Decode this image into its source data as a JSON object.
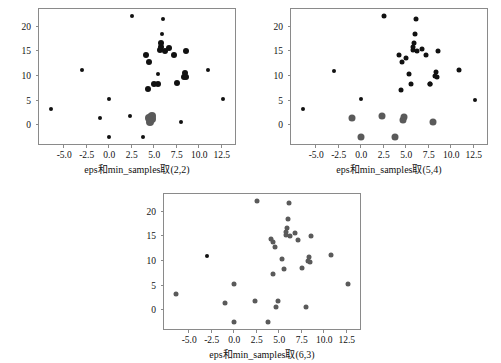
{
  "figure": {
    "background": "#ffffff",
    "width": 501,
    "height": 363
  },
  "chart_data": [
    {
      "type": "scatter",
      "id": "panel-2-2",
      "title": "",
      "xlabel": "eps和min_samples取(2,2)",
      "ylabel": "",
      "xlim": [
        -7.8,
        14.2
      ],
      "ylim": [
        -4.2,
        23.6
      ],
      "xticks": [
        "-5.0",
        "-2.5",
        "0.0",
        "2.5",
        "5.0",
        "7.5",
        "10.0",
        "12.5"
      ],
      "xtickvalues": [
        -5.0,
        -2.5,
        0.0,
        2.5,
        5.0,
        7.5,
        10.0,
        12.5
      ],
      "yticks": [
        "0",
        "5",
        "10",
        "15",
        "20"
      ],
      "ytickvalues": [
        0,
        5,
        10,
        15,
        20
      ],
      "grid": false,
      "legend": "none",
      "colors": {
        "noise": "#111111",
        "cluster0": "#5a5a5a"
      },
      "points": [
        {
          "x": -6.5,
          "y": 3.3,
          "c": "noise",
          "s": 4
        },
        {
          "x": -3.0,
          "y": 11.2,
          "c": "noise",
          "s": 4
        },
        {
          "x": -1.0,
          "y": 1.5,
          "c": "noise",
          "s": 4
        },
        {
          "x": 0.0,
          "y": 5.4,
          "c": "noise",
          "s": 4
        },
        {
          "x": 0.0,
          "y": -2.4,
          "c": "noise",
          "s": 4
        },
        {
          "x": 2.3,
          "y": 1.9,
          "c": "noise",
          "s": 4
        },
        {
          "x": 2.5,
          "y": 22.1,
          "c": "noise",
          "s": 4
        },
        {
          "x": 3.8,
          "y": -2.3,
          "c": "noise",
          "s": 4
        },
        {
          "x": 4.1,
          "y": 14.3,
          "c": "noise",
          "s": 6
        },
        {
          "x": 4.4,
          "y": 12.9,
          "c": "noise",
          "s": 6
        },
        {
          "x": 4.3,
          "y": 7.3,
          "c": "noise",
          "s": 6
        },
        {
          "x": 5.0,
          "y": 8.4,
          "c": "noise",
          "s": 6
        },
        {
          "x": 5.4,
          "y": 8.3,
          "c": "noise",
          "s": 6
        },
        {
          "x": 5.4,
          "y": 10.5,
          "c": "noise",
          "s": 4
        },
        {
          "x": 5.6,
          "y": 15.2,
          "c": "noise",
          "s": 6
        },
        {
          "x": 5.7,
          "y": 15.9,
          "c": "noise",
          "s": 6
        },
        {
          "x": 5.8,
          "y": 16.6,
          "c": "noise",
          "s": 6
        },
        {
          "x": 5.9,
          "y": 18.6,
          "c": "noise",
          "s": 4
        },
        {
          "x": 6.0,
          "y": 21.6,
          "c": "noise",
          "s": 4
        },
        {
          "x": 6.2,
          "y": 15.0,
          "c": "noise",
          "s": 6
        },
        {
          "x": 6.6,
          "y": 15.6,
          "c": "noise",
          "s": 6
        },
        {
          "x": 7.2,
          "y": 14.2,
          "c": "noise",
          "s": 6
        },
        {
          "x": 7.5,
          "y": 8.5,
          "c": "noise",
          "s": 6
        },
        {
          "x": 8.0,
          "y": 0.6,
          "c": "noise",
          "s": 4
        },
        {
          "x": 8.3,
          "y": 9.9,
          "c": "noise",
          "s": 6
        },
        {
          "x": 8.4,
          "y": 10.7,
          "c": "noise",
          "s": 6
        },
        {
          "x": 8.5,
          "y": 15.1,
          "c": "noise",
          "s": 6
        },
        {
          "x": 8.5,
          "y": 9.8,
          "c": "noise",
          "s": 6
        },
        {
          "x": 11.0,
          "y": 11.3,
          "c": "noise",
          "s": 4
        },
        {
          "x": 12.6,
          "y": 5.3,
          "c": "noise",
          "s": 4
        },
        {
          "x": 4.6,
          "y": 1.7,
          "c": "cluster0",
          "s": 8
        },
        {
          "x": 4.8,
          "y": 1.9,
          "c": "cluster0",
          "s": 8
        },
        {
          "x": 4.5,
          "y": 0.7,
          "c": "cluster0",
          "s": 8
        },
        {
          "x": 4.7,
          "y": 1.2,
          "c": "cluster0",
          "s": 8
        },
        {
          "x": 4.4,
          "y": 1.5,
          "c": "cluster0",
          "s": 8
        }
      ]
    },
    {
      "type": "scatter",
      "id": "panel-5-4",
      "title": "",
      "xlabel": "eps和min_samples取(5,4)",
      "ylabel": "",
      "xlim": [
        -7.8,
        14.2
      ],
      "ylim": [
        -4.2,
        23.6
      ],
      "xticks": [
        "-5.0",
        "-2.5",
        "0.0",
        "2.5",
        "5.0",
        "7.5",
        "10.0",
        "12.5"
      ],
      "xtickvalues": [
        -5.0,
        -2.5,
        0.0,
        2.5,
        5.0,
        7.5,
        10.0,
        12.5
      ],
      "yticks": [
        "0",
        "5",
        "10",
        "15",
        "20"
      ],
      "ytickvalues": [
        0,
        5,
        10,
        15,
        20
      ],
      "grid": false,
      "legend": "none",
      "colors": {
        "noise": "#111111",
        "cluster0": "#5a5a5a"
      },
      "points": [
        {
          "x": -6.5,
          "y": 3.3,
          "c": "noise",
          "s": 4
        },
        {
          "x": -3.0,
          "y": 11.1,
          "c": "noise",
          "s": 4
        },
        {
          "x": 0.0,
          "y": 5.3,
          "c": "noise",
          "s": 4
        },
        {
          "x": 2.5,
          "y": 22.1,
          "c": "noise",
          "s": 5
        },
        {
          "x": 4.2,
          "y": 14.3,
          "c": "noise",
          "s": 5
        },
        {
          "x": 4.5,
          "y": 12.8,
          "c": "noise",
          "s": 5
        },
        {
          "x": 4.4,
          "y": 7.2,
          "c": "noise",
          "s": 5
        },
        {
          "x": 5.0,
          "y": 13.6,
          "c": "noise",
          "s": 5
        },
        {
          "x": 5.3,
          "y": 10.4,
          "c": "noise",
          "s": 5
        },
        {
          "x": 5.5,
          "y": 8.3,
          "c": "noise",
          "s": 5
        },
        {
          "x": 5.7,
          "y": 15.2,
          "c": "noise",
          "s": 5
        },
        {
          "x": 5.8,
          "y": 15.9,
          "c": "noise",
          "s": 5
        },
        {
          "x": 5.9,
          "y": 16.6,
          "c": "noise",
          "s": 5
        },
        {
          "x": 6.0,
          "y": 18.6,
          "c": "noise",
          "s": 5
        },
        {
          "x": 6.1,
          "y": 21.6,
          "c": "noise",
          "s": 5
        },
        {
          "x": 6.2,
          "y": 15.0,
          "c": "noise",
          "s": 5
        },
        {
          "x": 6.7,
          "y": 15.5,
          "c": "noise",
          "s": 5
        },
        {
          "x": 7.2,
          "y": 14.2,
          "c": "noise",
          "s": 5
        },
        {
          "x": 7.6,
          "y": 8.4,
          "c": "noise",
          "s": 5
        },
        {
          "x": 8.2,
          "y": 10.1,
          "c": "noise",
          "s": 5
        },
        {
          "x": 8.3,
          "y": 10.8,
          "c": "noise",
          "s": 5
        },
        {
          "x": 8.4,
          "y": 9.8,
          "c": "noise",
          "s": 5
        },
        {
          "x": 8.5,
          "y": 15.0,
          "c": "noise",
          "s": 5
        },
        {
          "x": 7.6,
          "y": 8.4,
          "c": "noise",
          "s": 5
        },
        {
          "x": 10.9,
          "y": 11.2,
          "c": "noise",
          "s": 5
        },
        {
          "x": 12.6,
          "y": 5.2,
          "c": "noise",
          "s": 4
        },
        {
          "x": -1.0,
          "y": 1.4,
          "c": "cluster0",
          "s": 7
        },
        {
          "x": 0.0,
          "y": -2.4,
          "c": "cluster0",
          "s": 7
        },
        {
          "x": 2.3,
          "y": 1.8,
          "c": "cluster0",
          "s": 7
        },
        {
          "x": 3.8,
          "y": -2.3,
          "c": "cluster0",
          "s": 7
        },
        {
          "x": 4.6,
          "y": 1.0,
          "c": "cluster0",
          "s": 7
        },
        {
          "x": 4.8,
          "y": 1.7,
          "c": "cluster0",
          "s": 7
        },
        {
          "x": 8.0,
          "y": 0.6,
          "c": "cluster0",
          "s": 7
        }
      ]
    },
    {
      "type": "scatter",
      "id": "panel-6-3",
      "title": "",
      "xlabel": "eps和min_samples取(6,3)",
      "ylabel": "",
      "xlim": [
        -7.8,
        14.2
      ],
      "ylim": [
        -4.2,
        23.6
      ],
      "xticks": [
        "-5.0",
        "-2.5",
        "0.0",
        "2.5",
        "5.0",
        "7.5",
        "10.0",
        "12.5"
      ],
      "xtickvalues": [
        -5.0,
        -2.5,
        0.0,
        2.5,
        5.0,
        7.5,
        10.0,
        12.5
      ],
      "yticks": [
        "0",
        "5",
        "10",
        "15",
        "20"
      ],
      "ytickvalues": [
        0,
        5,
        10,
        15,
        20
      ],
      "grid": false,
      "legend": "none",
      "colors": {
        "noise": "#111111",
        "cluster0": "#5a5a5a"
      },
      "points": [
        {
          "x": -3.0,
          "y": 11.1,
          "c": "noise",
          "s": 4
        },
        {
          "x": -6.5,
          "y": 3.3,
          "c": "cluster0",
          "s": 5
        },
        {
          "x": -1.0,
          "y": 1.4,
          "c": "cluster0",
          "s": 5
        },
        {
          "x": 0.0,
          "y": 5.4,
          "c": "cluster0",
          "s": 5
        },
        {
          "x": 0.0,
          "y": -2.4,
          "c": "cluster0",
          "s": 5
        },
        {
          "x": 2.3,
          "y": 1.8,
          "c": "cluster0",
          "s": 5
        },
        {
          "x": 2.5,
          "y": 22.1,
          "c": "cluster0",
          "s": 5
        },
        {
          "x": 3.8,
          "y": -2.3,
          "c": "cluster0",
          "s": 5
        },
        {
          "x": 4.1,
          "y": 14.4,
          "c": "cluster0",
          "s": 5
        },
        {
          "x": 4.3,
          "y": 13.9,
          "c": "cluster0",
          "s": 5
        },
        {
          "x": 4.5,
          "y": 12.8,
          "c": "cluster0",
          "s": 5
        },
        {
          "x": 4.3,
          "y": 7.4,
          "c": "cluster0",
          "s": 5
        },
        {
          "x": 4.6,
          "y": 0.6,
          "c": "cluster0",
          "s": 5
        },
        {
          "x": 4.9,
          "y": 1.8,
          "c": "cluster0",
          "s": 5
        },
        {
          "x": 5.3,
          "y": 10.5,
          "c": "cluster0",
          "s": 5
        },
        {
          "x": 5.5,
          "y": 8.4,
          "c": "cluster0",
          "s": 5
        },
        {
          "x": 5.7,
          "y": 15.2,
          "c": "cluster0",
          "s": 5
        },
        {
          "x": 5.8,
          "y": 15.9,
          "c": "cluster0",
          "s": 5
        },
        {
          "x": 5.9,
          "y": 16.6,
          "c": "cluster0",
          "s": 5
        },
        {
          "x": 6.0,
          "y": 18.6,
          "c": "cluster0",
          "s": 5
        },
        {
          "x": 6.1,
          "y": 21.8,
          "c": "cluster0",
          "s": 5
        },
        {
          "x": 6.2,
          "y": 15.0,
          "c": "cluster0",
          "s": 5
        },
        {
          "x": 6.7,
          "y": 15.6,
          "c": "cluster0",
          "s": 5
        },
        {
          "x": 7.1,
          "y": 14.3,
          "c": "cluster0",
          "s": 5
        },
        {
          "x": 7.5,
          "y": 8.5,
          "c": "cluster0",
          "s": 5
        },
        {
          "x": 8.0,
          "y": 0.6,
          "c": "cluster0",
          "s": 5
        },
        {
          "x": 8.2,
          "y": 10.1,
          "c": "cluster0",
          "s": 5
        },
        {
          "x": 8.3,
          "y": 10.8,
          "c": "cluster0",
          "s": 5
        },
        {
          "x": 8.4,
          "y": 9.8,
          "c": "cluster0",
          "s": 5
        },
        {
          "x": 8.5,
          "y": 15.1,
          "c": "cluster0",
          "s": 5
        },
        {
          "x": 10.8,
          "y": 11.3,
          "c": "cluster0",
          "s": 5
        },
        {
          "x": 12.6,
          "y": 5.4,
          "c": "cluster0",
          "s": 5
        }
      ]
    }
  ],
  "panels": [
    {
      "name": "panel-top-left",
      "left": 38,
      "top": 8,
      "width": 198,
      "height": 137,
      "chart": 0,
      "label_center": 133
    },
    {
      "name": "panel-top-right",
      "left": 290,
      "top": 8,
      "width": 198,
      "height": 137,
      "chart": 1,
      "label_center": 385
    },
    {
      "name": "panel-bottom",
      "left": 163,
      "top": 193,
      "width": 198,
      "height": 137,
      "chart": 2,
      "label_center": 258
    }
  ]
}
